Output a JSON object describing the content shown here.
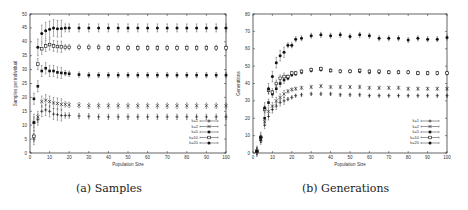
{
  "captions": {
    "a": "(a) Samples",
    "b": "(b) Generations"
  },
  "chart_data": [
    {
      "type": "scatter",
      "title": "(a) Samples",
      "xlabel": "Population Size",
      "ylabel": "Samples per individual",
      "xlim": [
        0,
        100
      ],
      "ylim": [
        0,
        50
      ],
      "xticks": [
        0,
        10,
        20,
        30,
        40,
        50,
        60,
        70,
        80,
        90,
        100
      ],
      "yticks": [
        0,
        5,
        10,
        15,
        20,
        25,
        30,
        35,
        40,
        45,
        50
      ],
      "grid": false,
      "error_bars": true,
      "legend_position": "lower right",
      "x": [
        2,
        4,
        6,
        8,
        10,
        12,
        14,
        16,
        18,
        20,
        25,
        30,
        35,
        40,
        45,
        50,
        55,
        60,
        65,
        70,
        75,
        80,
        85,
        90,
        95,
        100
      ],
      "series": [
        {
          "name": "k=1",
          "marker": "plus",
          "values": [
            5,
            12,
            15,
            15.5,
            15,
            14,
            13.8,
            13.5,
            13.5,
            13.5,
            13.3,
            13.2,
            13,
            13,
            13,
            13,
            13,
            13,
            13,
            13,
            13,
            13,
            13,
            13,
            13,
            13
          ]
        },
        {
          "name": "k=2",
          "marker": "cross",
          "values": [
            11,
            13,
            18.5,
            19,
            18.5,
            18,
            17.8,
            17.5,
            17.5,
            17.3,
            17.2,
            17,
            17,
            17,
            17,
            17,
            17,
            17,
            17,
            17,
            17,
            17,
            17,
            17,
            17,
            17
          ]
        },
        {
          "name": "k=5",
          "marker": "filled-square",
          "values": [
            19.5,
            24,
            29.5,
            30.5,
            29.5,
            29.5,
            29,
            28.8,
            28.7,
            28.5,
            28.2,
            28,
            28,
            28,
            28,
            28,
            28,
            28,
            28,
            28,
            28,
            28,
            28,
            28,
            28,
            28
          ]
        },
        {
          "name": "k=10",
          "marker": "open-square",
          "values": [
            6,
            32,
            37.5,
            38.5,
            39,
            38.5,
            38.3,
            38.2,
            38,
            38,
            38,
            38,
            38,
            37.8,
            37.8,
            37.8,
            37.8,
            37.8,
            37.8,
            37.8,
            37.8,
            37.8,
            37.8,
            37.8,
            37.8,
            37.8
          ]
        },
        {
          "name": "k=20",
          "marker": "filled-circle",
          "values": [
            11,
            38,
            43,
            44,
            44.5,
            45,
            44.7,
            44.8,
            45,
            45,
            45,
            45,
            45,
            45,
            45,
            45,
            45,
            45,
            45,
            45,
            45,
            45,
            45,
            45,
            45,
            45
          ]
        }
      ]
    },
    {
      "type": "scatter",
      "title": "(b) Generations",
      "xlabel": "Population Size",
      "ylabel": "Generations",
      "xlim": [
        0,
        100
      ],
      "ylim": [
        0,
        80
      ],
      "xticks": [
        0,
        10,
        20,
        30,
        40,
        50,
        60,
        70,
        80,
        90,
        100
      ],
      "yticks": [
        0,
        10,
        20,
        30,
        40,
        50,
        60,
        70,
        80
      ],
      "grid": false,
      "error_bars": true,
      "legend_position": "lower right",
      "x": [
        2,
        4,
        6,
        8,
        10,
        12,
        14,
        16,
        18,
        20,
        22,
        25,
        30,
        35,
        40,
        45,
        50,
        55,
        60,
        65,
        70,
        75,
        80,
        85,
        90,
        95,
        100
      ],
      "series": [
        {
          "name": "k=1",
          "marker": "plus",
          "values": [
            1,
            7,
            16,
            21,
            25,
            27,
            29,
            30,
            31,
            32,
            33,
            33.5,
            34,
            34,
            34,
            33.5,
            33.5,
            33.5,
            33,
            33,
            33,
            33,
            33,
            33,
            33,
            33,
            33
          ]
        },
        {
          "name": "k=2",
          "marker": "cross",
          "values": [
            1,
            8,
            18,
            24,
            27,
            30,
            32,
            34,
            35.5,
            36.5,
            37,
            37.5,
            38,
            38.5,
            38,
            38,
            38,
            38,
            37.5,
            37.5,
            37.5,
            37.5,
            37,
            37,
            37,
            37,
            37
          ]
        },
        {
          "name": "k=5",
          "marker": "filled-square",
          "values": [
            1,
            8,
            20,
            29,
            34,
            37,
            40,
            42,
            43,
            45,
            45.5,
            46.5,
            47.5,
            48,
            47.5,
            47,
            47,
            47,
            46.5,
            46.5,
            46.5,
            46.5,
            46.5,
            46,
            46,
            46,
            46
          ]
        },
        {
          "name": "k=10",
          "marker": "open-square",
          "values": [
            1,
            9,
            25,
            36,
            35,
            40,
            43,
            44,
            44,
            46,
            46,
            47,
            48,
            48.5,
            47.5,
            47,
            47,
            47.5,
            47,
            47,
            46.5,
            46.5,
            46.5,
            46,
            46,
            46,
            46
          ]
        },
        {
          "name": "k=20",
          "marker": "filled-circle",
          "values": [
            1,
            9,
            26,
            37,
            44,
            52,
            56,
            58,
            62,
            62,
            65.5,
            66,
            67.5,
            68,
            67.5,
            68,
            67,
            68,
            67.5,
            66,
            66,
            66,
            65,
            66,
            65.5,
            65.5,
            66.5
          ]
        }
      ]
    }
  ]
}
